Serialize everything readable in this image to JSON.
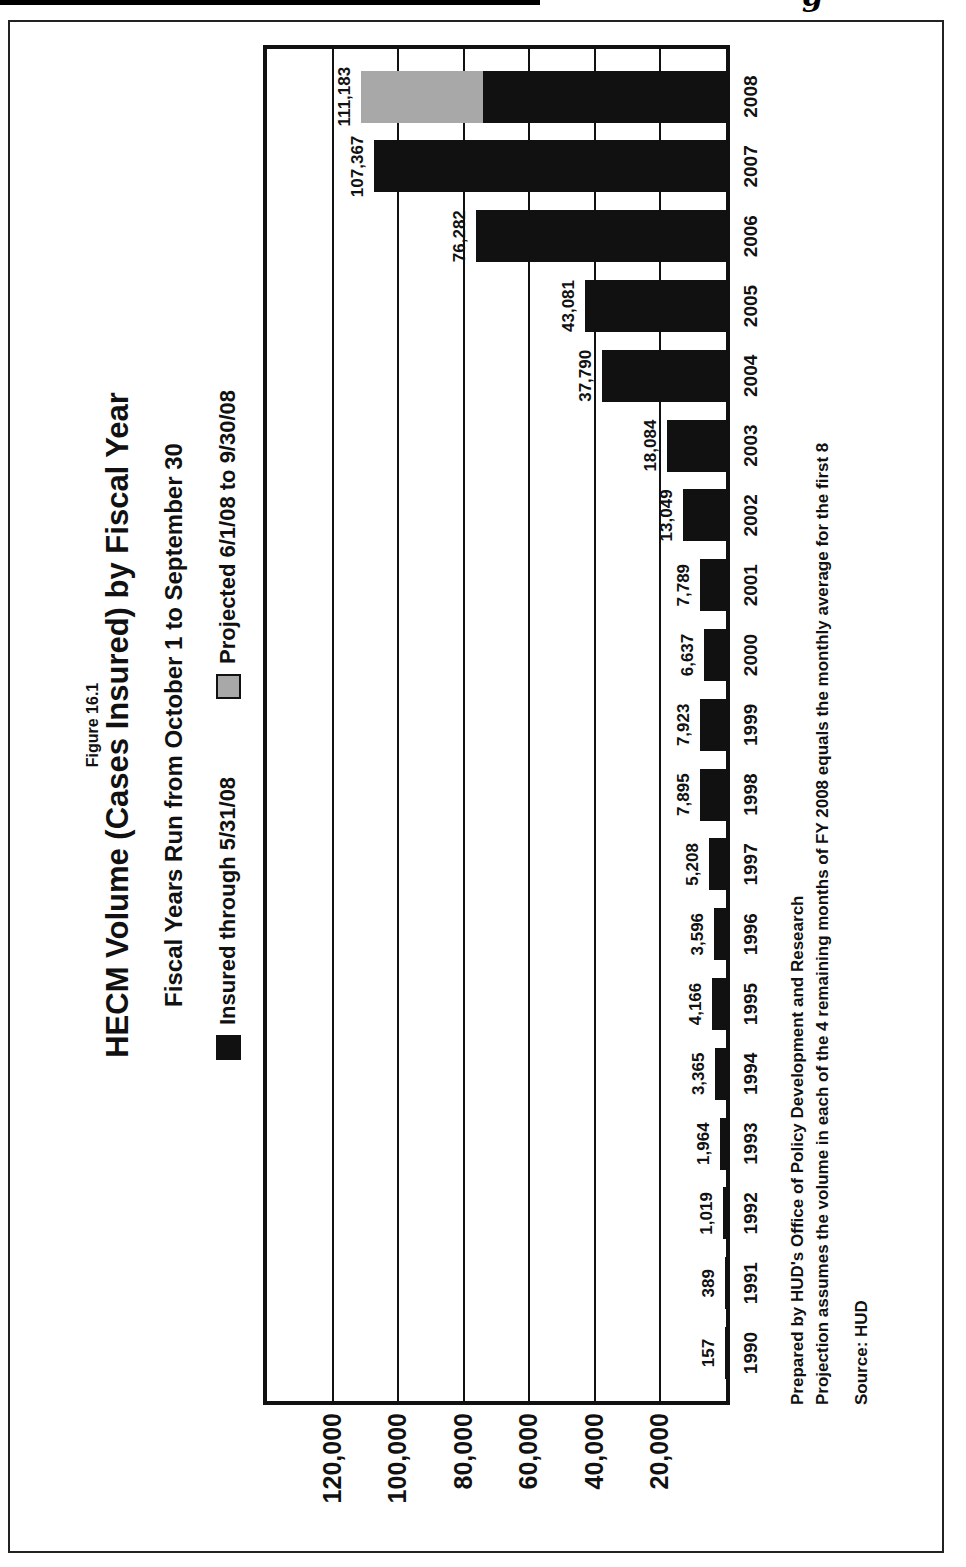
{
  "scan": {
    "header_fragment": "g g"
  },
  "figure": {
    "label": "Figure 16.1",
    "title": "HECM Volume (Cases Insured) by Fiscal Year",
    "subtitle": "Fiscal Years Run from October 1 to September 30"
  },
  "legend": [
    {
      "label": "Insured through 5/31/08",
      "color": "#111111"
    },
    {
      "label": "Projected 6/1/08 to 9/30/08",
      "color": "#a8a8a8"
    }
  ],
  "chart_data": {
    "type": "bar",
    "title": "HECM Volume (Cases Insured) by Fiscal Year",
    "subtitle": "Fiscal Years Run from October 1 to September 30",
    "orientation": "chart drawn landscape, rotated 90deg counter-clockwise on the page",
    "legend_position": "top",
    "grid": true,
    "categories": [
      "1990",
      "1991",
      "1992",
      "1993",
      "1994",
      "1995",
      "1996",
      "1997",
      "1998",
      "1999",
      "2000",
      "2001",
      "2002",
      "2003",
      "2004",
      "2005",
      "2006",
      "2007",
      "2008"
    ],
    "series": [
      {
        "name": "Insured through 5/31/08",
        "color": "#111111",
        "values": [
          157,
          389,
          1019,
          1964,
          3365,
          4166,
          3596,
          5208,
          7895,
          7923,
          6637,
          7789,
          13049,
          18084,
          37790,
          43081,
          76282,
          107367,
          74122
        ]
      },
      {
        "name": "Projected 6/1/08 to 9/30/08",
        "color": "#a8a8a8",
        "values": [
          0,
          0,
          0,
          0,
          0,
          0,
          0,
          0,
          0,
          0,
          0,
          0,
          0,
          0,
          0,
          0,
          0,
          0,
          37061
        ]
      }
    ],
    "bar_total_labels": [
      "157",
      "389",
      "1,019",
      "1,964",
      "3,365",
      "4,166",
      "3,596",
      "5,208",
      "7,895",
      "7,923",
      "6,637",
      "7,789",
      "13,049",
      "18,084",
      "37,790",
      "43,081",
      "76,282",
      "107,367",
      "111,183"
    ],
    "assumptions": "Only the 111,183 total is printed for 2008; its black/gray split follows the projection rule stated in the notes (total = 12/8 of insured-through-5/31/08).",
    "value_axis": {
      "min": 0,
      "max": 140000,
      "tick_values": [
        20000,
        40000,
        60000,
        80000,
        100000,
        120000
      ],
      "tick_labels": [
        "20,000",
        "40,000",
        "60,000",
        "80,000",
        "100,000",
        "120,000"
      ]
    }
  },
  "notes": {
    "prepared": "Prepared by HUD's Office of Policy Development and Research",
    "projection": "Projection assumes the volume in each of the 4 remaining months of FY 2008 equals the monthly average for the first 8",
    "source": "Source: HUD"
  }
}
